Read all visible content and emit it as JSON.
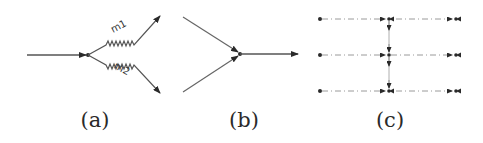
{
  "figure": {
    "panels": [
      {
        "id": "a",
        "caption": "(a)",
        "description": "One incoming line splits into two outgoing wavy branches",
        "branch_labels": [
          "m1",
          "m2"
        ]
      },
      {
        "id": "b",
        "caption": "(b)",
        "description": "Two incoming lines merge into one outgoing arrow"
      },
      {
        "id": "c",
        "caption": "(c)",
        "description": "Three dashed horizontal rows with double-arrow markers and vertical arrows connecting rows"
      }
    ],
    "colors": {
      "line": "#555555",
      "arrow": "#2a2a2a",
      "dashed": "#9a9a9a",
      "background": "#ffffff"
    }
  }
}
